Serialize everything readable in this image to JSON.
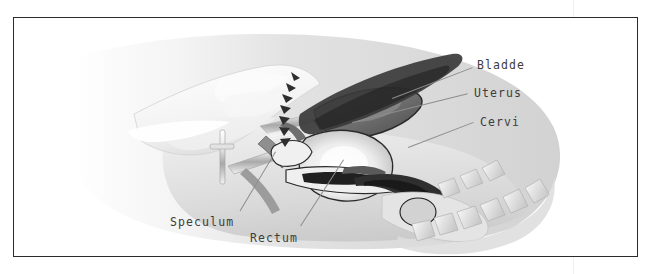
{
  "figure": {
    "border_color": "#2b2b2b",
    "background_color": "#ffffff",
    "style": "grayscale medical illustration"
  },
  "labels": [
    {
      "id": "bladder",
      "text": "Bladde",
      "x": 477,
      "y": 59,
      "align": "left"
    },
    {
      "id": "uterus",
      "text": "Uterus",
      "x": 474,
      "y": 87,
      "align": "left"
    },
    {
      "id": "cervix",
      "text": "Cervi",
      "x": 480,
      "y": 116,
      "align": "left"
    },
    {
      "id": "speculum",
      "text": "Speculum",
      "x": 170,
      "y": 216,
      "align": "left"
    },
    {
      "id": "rectum",
      "text": "Rectum",
      "x": 250,
      "y": 232,
      "align": "left"
    }
  ],
  "leader_lines": [
    {
      "id": "bladder-leader",
      "x1": 471,
      "y1": 65,
      "x2": 392,
      "y2": 98
    },
    {
      "id": "uterus-leader",
      "x1": 468,
      "y1": 93,
      "x2": 352,
      "y2": 122
    },
    {
      "id": "cervix-leader",
      "x1": 474,
      "y1": 122,
      "x2": 408,
      "y2": 147
    },
    {
      "id": "speculum-leader",
      "x1": 240,
      "y1": 211,
      "x2": 276,
      "y2": 152
    },
    {
      "id": "rectum-leader",
      "x1": 300,
      "y1": 227,
      "x2": 344,
      "y2": 160
    }
  ],
  "colors": {
    "label_text": "#3d3d3d",
    "leader_line": "#8d8d8d",
    "frame": "#2b2b2b",
    "tissue_light": "#e8e8e8",
    "tissue_mid": "#bfbfbf",
    "tissue_dark": "#6f6f6f",
    "outline": "#1f1f1f",
    "instrument": "#d9d9d9"
  },
  "divider": {
    "x": 573
  }
}
